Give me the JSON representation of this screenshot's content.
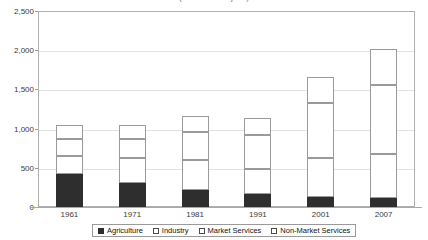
{
  "chart_data": {
    "type": "bar",
    "subtype": "stacked-column",
    "title": "(thousands of jobs)",
    "xlabel": "",
    "ylabel": "",
    "categories": [
      "1961",
      "1971",
      "1981",
      "1991",
      "2001",
      "2007"
    ],
    "series": [
      {
        "name": "Agriculture",
        "values": [
          420,
          300,
          220,
          160,
          130,
          110
        ],
        "color": "#2e2e2e"
      },
      {
        "name": "Industry",
        "values": [
          230,
          320,
          380,
          330,
          500,
          570
        ],
        "color": "#ffffff"
      },
      {
        "name": "Market Services",
        "values": [
          220,
          250,
          360,
          430,
          700,
          880
        ],
        "color": "#ffffff"
      },
      {
        "name": "Non-Market Services",
        "values": [
          180,
          180,
          200,
          220,
          330,
          460
        ],
        "color": "#ffffff"
      }
    ],
    "totals": [
      1050,
      1050,
      1160,
      1140,
      1660,
      2020
    ],
    "ylim": [
      0,
      2500
    ],
    "yticks": [
      0,
      500,
      1000,
      1500,
      2000,
      2500
    ],
    "ytick_labels": [
      "0",
      "500",
      "1,000",
      "1,500",
      "2,000",
      "2,500"
    ],
    "grid": true,
    "grid_axis": "y",
    "legend_position": "bottom"
  },
  "legend": {
    "items": [
      {
        "label": "Agriculture",
        "style": "filled"
      },
      {
        "label": "Industry",
        "style": "hollow"
      },
      {
        "label": "Market Services",
        "style": "hollow"
      },
      {
        "label": "Non-Market Services",
        "style": "hollow"
      }
    ]
  }
}
